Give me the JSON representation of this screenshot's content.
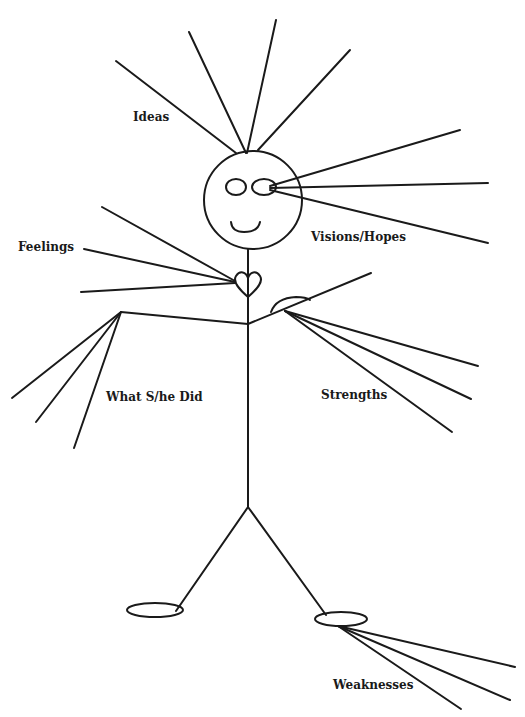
{
  "diagram": {
    "labels": {
      "ideas": "Ideas",
      "visions": "Visions/Hopes",
      "feelings": "Feelings",
      "did": "What S/he Did",
      "strengths": "Strengths",
      "weaknesses": "Weaknesses"
    },
    "stroke_color": "#1a1a1a",
    "background": "#ffffff"
  }
}
